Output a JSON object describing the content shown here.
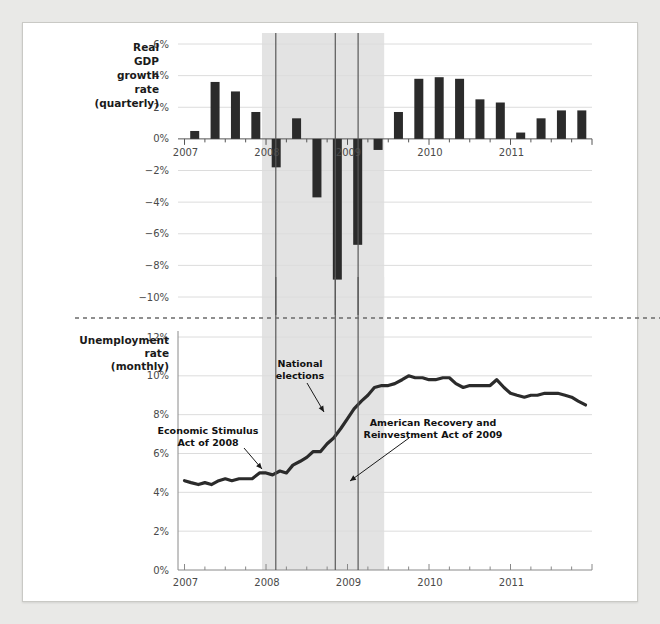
{
  "figure": {
    "background_color": "#e9e9e7",
    "page_color": "#ffffff",
    "shading_color": "#e3e3e3",
    "bar_color": "#2b2b2b",
    "line_color": "#2b2b2b"
  },
  "panels": {
    "top": {
      "side_label_lines": [
        "Real",
        "GDP",
        "growth",
        "rate",
        "(quarterly)"
      ],
      "ytick_labels": [
        "6%",
        "4%",
        "2%",
        "0%",
        "−2%",
        "−4%",
        "−6%",
        "−8%",
        "−10%"
      ],
      "xtick_labels": [
        "2007",
        "2008",
        "2009",
        "2010",
        "2011"
      ]
    },
    "bottom": {
      "side_label_lines": [
        "Unemployment",
        "rate",
        "(monthly)"
      ],
      "ytick_labels": [
        "12%",
        "10%",
        "8%",
        "6%",
        "4%",
        "2%",
        "0%"
      ],
      "xtick_labels": [
        "2007",
        "2008",
        "2009",
        "2010",
        "2011"
      ]
    }
  },
  "annotations": [
    {
      "id": "economic-stimulus",
      "lines": [
        "Economic Stimulus",
        "Act of 2008"
      ]
    },
    {
      "id": "national-elections",
      "lines": [
        "National",
        "elections"
      ]
    },
    {
      "id": "arra",
      "lines": [
        "American Recovery and",
        "Reinvestment Act of 2009"
      ]
    }
  ],
  "event_lines": [
    {
      "id": "stimulus-2008",
      "year": 2008.12
    },
    {
      "id": "election-2008",
      "year": 2008.85
    },
    {
      "id": "arra-2009",
      "year": 2009.13
    }
  ],
  "recession_band": {
    "start": 2007.95,
    "end": 2009.45
  },
  "chart_data": [
    {
      "type": "bar",
      "id": "real-gdp-growth",
      "title": "Real GDP growth rate (quarterly)",
      "xlabel": "",
      "ylabel": "Real GDP growth rate (quarterly)",
      "ylim": [
        -10,
        6
      ],
      "yticks": [
        6,
        4,
        2,
        0,
        -2,
        -4,
        -6,
        -8,
        -10
      ],
      "grid": true,
      "categories": [
        "2007 Q1",
        "2007 Q2",
        "2007 Q3",
        "2007 Q4",
        "2008 Q1",
        "2008 Q2",
        "2008 Q3",
        "2008 Q4",
        "2009 Q1",
        "2009 Q2",
        "2009 Q3",
        "2009 Q4",
        "2010 Q1",
        "2010 Q2",
        "2010 Q3",
        "2010 Q4",
        "2011 Q1",
        "2011 Q2",
        "2011 Q3",
        "2011 Q4"
      ],
      "x": [
        2007.0,
        2007.25,
        2007.5,
        2007.75,
        2008.0,
        2008.25,
        2008.5,
        2008.75,
        2009.0,
        2009.25,
        2009.5,
        2009.75,
        2010.0,
        2010.25,
        2010.5,
        2010.75,
        2011.0,
        2011.25,
        2011.5,
        2011.75
      ],
      "values": [
        0.5,
        3.6,
        3.0,
        1.7,
        -1.8,
        1.3,
        -3.7,
        -8.9,
        -6.7,
        -0.7,
        1.7,
        3.8,
        3.9,
        3.8,
        2.5,
        2.3,
        0.4,
        1.3,
        1.8,
        1.8
      ]
    },
    {
      "type": "line",
      "id": "unemployment-rate",
      "title": "Unemployment rate (monthly)",
      "xlabel": "",
      "ylabel": "Unemployment rate (monthly)",
      "ylim": [
        0,
        12
      ],
      "yticks": [
        12,
        10,
        8,
        6,
        4,
        2,
        0
      ],
      "grid": true,
      "x": [
        2007.0,
        2007.08,
        2007.17,
        2007.25,
        2007.33,
        2007.42,
        2007.5,
        2007.58,
        2007.67,
        2007.75,
        2007.83,
        2007.92,
        2008.0,
        2008.08,
        2008.17,
        2008.25,
        2008.33,
        2008.42,
        2008.5,
        2008.58,
        2008.67,
        2008.75,
        2008.83,
        2008.92,
        2009.0,
        2009.08,
        2009.17,
        2009.25,
        2009.33,
        2009.42,
        2009.5,
        2009.58,
        2009.67,
        2009.75,
        2009.83,
        2009.92,
        2010.0,
        2010.08,
        2010.17,
        2010.25,
        2010.33,
        2010.42,
        2010.5,
        2010.58,
        2010.67,
        2010.75,
        2010.83,
        2010.92,
        2011.0,
        2011.08,
        2011.17,
        2011.25,
        2011.33,
        2011.42,
        2011.5,
        2011.58,
        2011.67,
        2011.75,
        2011.83,
        2011.92
      ],
      "values": [
        4.6,
        4.5,
        4.4,
        4.5,
        4.4,
        4.6,
        4.7,
        4.6,
        4.7,
        4.7,
        4.7,
        5.0,
        5.0,
        4.9,
        5.1,
        5.0,
        5.4,
        5.6,
        5.8,
        6.1,
        6.1,
        6.5,
        6.8,
        7.3,
        7.8,
        8.3,
        8.7,
        9.0,
        9.4,
        9.5,
        9.5,
        9.6,
        9.8,
        10.0,
        9.9,
        9.9,
        9.8,
        9.8,
        9.9,
        9.9,
        9.6,
        9.4,
        9.5,
        9.5,
        9.5,
        9.5,
        9.8,
        9.4,
        9.1,
        9.0,
        8.9,
        9.0,
        9.0,
        9.1,
        9.1,
        9.1,
        9.0,
        8.9,
        8.7,
        8.5
      ]
    }
  ]
}
